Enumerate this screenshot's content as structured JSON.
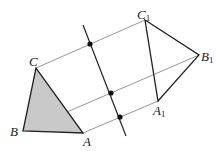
{
  "diagram": {
    "colors": {
      "triangle_fill": "#c9c9c9",
      "stroke": "#222222",
      "guide": "#8a8a8a"
    },
    "points": {
      "A": {
        "label": "A",
        "x": 83,
        "y": 133
      },
      "B": {
        "label": "B",
        "x": 23,
        "y": 131
      },
      "C": {
        "label": "C",
        "x": 36,
        "y": 68
      },
      "A1": {
        "label": "A",
        "sub": "1",
        "x": 158,
        "y": 101
      },
      "B1": {
        "label": "B",
        "sub": "1",
        "x": 199,
        "y": 55
      },
      "C1": {
        "label": "C",
        "sub": "1",
        "x": 145,
        "y": 20
      }
    },
    "mirror_line": {
      "x1": 83,
      "y1": 25,
      "x2": 126,
      "y2": 136
    },
    "midpoints": [
      {
        "x": 90,
        "y": 44
      },
      {
        "x": 111,
        "y": 93
      },
      {
        "x": 120,
        "y": 117
      }
    ]
  }
}
